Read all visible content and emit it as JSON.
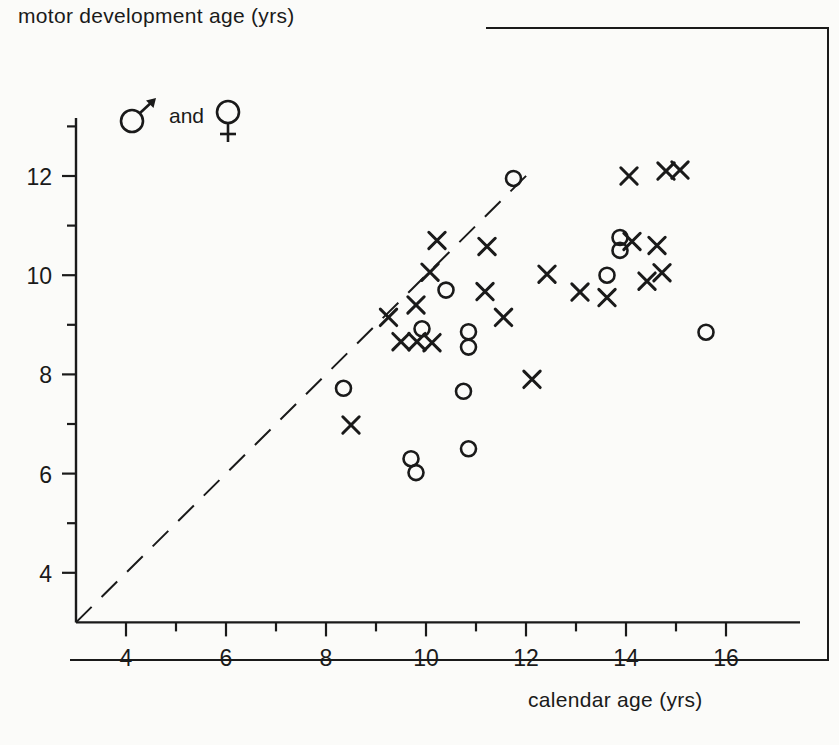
{
  "chart_data": {
    "type": "scatter",
    "title": "",
    "xlabel": "calendar age (yrs)",
    "ylabel": "motor development age (yrs)",
    "xlim": [
      3,
      17
    ],
    "ylim": [
      3,
      13.2
    ],
    "xticks": [
      4,
      6,
      8,
      10,
      12,
      14,
      16
    ],
    "yticks": [
      4,
      6,
      8,
      10,
      12
    ],
    "xtick_labels": [
      "4",
      "6",
      "8",
      "10",
      "12",
      "14",
      "16"
    ],
    "ytick_labels": [
      "4",
      "6",
      "8",
      "10",
      "12"
    ],
    "minor_tick_step": 1,
    "grid": false,
    "legend_position": "upper-left-inside",
    "legend": [
      {
        "symbol": "male-symbol",
        "label": "♂"
      },
      {
        "symbol": "conjunction",
        "label": "and"
      },
      {
        "symbol": "female-symbol",
        "label": "♀"
      }
    ],
    "annotations": [
      {
        "name": "identity-line",
        "style": "dashed",
        "from": [
          3,
          3
        ],
        "to": [
          12.05,
          12.05
        ],
        "description": "diagonal line of equality"
      }
    ],
    "series": [
      {
        "name": "male",
        "marker": "circle",
        "points": [
          [
            8.35,
            7.72
          ],
          [
            9.7,
            6.3
          ],
          [
            9.8,
            6.02
          ],
          [
            9.92,
            8.92
          ],
          [
            10.4,
            9.7
          ],
          [
            10.75,
            7.66
          ],
          [
            10.85,
            8.86
          ],
          [
            10.85,
            8.55
          ],
          [
            10.85,
            6.5
          ],
          [
            11.75,
            11.95
          ],
          [
            13.62,
            10.0
          ],
          [
            13.88,
            10.76
          ],
          [
            13.88,
            10.5
          ],
          [
            15.6,
            8.85
          ]
        ]
      },
      {
        "name": "female",
        "marker": "cross",
        "points": [
          [
            8.5,
            6.98
          ],
          [
            9.25,
            9.15
          ],
          [
            9.5,
            8.66
          ],
          [
            9.8,
            9.4
          ],
          [
            9.82,
            8.66
          ],
          [
            10.08,
            10.06
          ],
          [
            10.12,
            8.64
          ],
          [
            10.22,
            10.7
          ],
          [
            11.18,
            9.67
          ],
          [
            11.22,
            10.58
          ],
          [
            11.55,
            9.15
          ],
          [
            12.12,
            7.9
          ],
          [
            12.42,
            10.02
          ],
          [
            13.08,
            9.66
          ],
          [
            13.62,
            9.55
          ],
          [
            14.06,
            12.0
          ],
          [
            14.12,
            10.68
          ],
          [
            14.42,
            9.88
          ],
          [
            14.62,
            10.6
          ],
          [
            14.72,
            10.05
          ],
          [
            14.8,
            12.1
          ],
          [
            15.08,
            12.12
          ]
        ]
      }
    ]
  }
}
